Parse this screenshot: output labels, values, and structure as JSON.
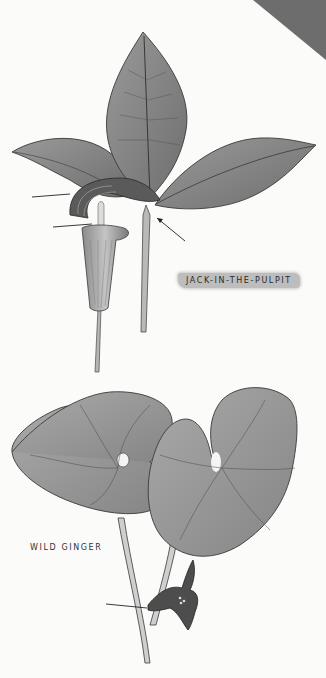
{
  "page": {
    "corner_tab_color": "#6d6d6d",
    "background": "#fbfbfa"
  },
  "plants": [
    {
      "name": "Jack-in-the-Pulpit",
      "label": "JACK-IN-THE-PULPIT",
      "label_style": "gray brush-stroke highlight",
      "parts": [
        "three-lobed leaf",
        "spathe (hood)",
        "spadix",
        "leaf stalk",
        "flower stalk"
      ],
      "pointer_arrows": 3
    },
    {
      "name": "Wild Ginger",
      "label": "WILD GINGER",
      "parts": [
        "two heart-shaped leaves",
        "hairy stalks",
        "cup-shaped flower at base"
      ],
      "pointer_arrows": 1
    }
  ]
}
